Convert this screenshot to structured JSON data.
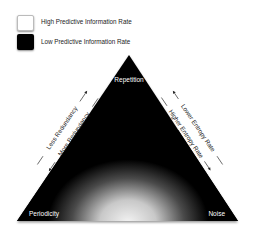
{
  "legend": {
    "items": [
      {
        "label": "High Predictive Information Rate",
        "swatch_color": "#ffffff"
      },
      {
        "label": "Low Predictive Information Rate",
        "swatch_color": "#000000"
      }
    ]
  },
  "triangle": {
    "fill_color": "#000000",
    "glow_color": "#ffffff",
    "vertices": {
      "top": "Repetition",
      "bottom_left": "Periodicity",
      "bottom_right": "Noise"
    },
    "left_side": {
      "outer": "Less Redundancy",
      "inner": "More Redundancy"
    },
    "right_side": {
      "outer": "Lower Entropy Rate",
      "inner": "Higher Entropy Rate"
    }
  }
}
